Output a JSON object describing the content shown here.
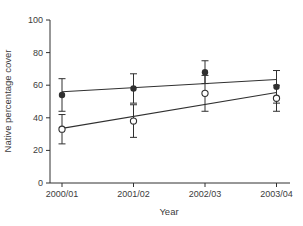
{
  "figure": {
    "background": "#ffffff",
    "text_color": "#3c3c3c",
    "line_color": "#303030"
  },
  "chart_data": {
    "type": "line",
    "xlabel": "Year",
    "ylabel": "Native percentage cover",
    "ylim": [
      0,
      100
    ],
    "yticks": [
      0,
      20,
      40,
      60,
      80,
      100
    ],
    "grid": "off",
    "legend_position": "none",
    "categories": [
      "2000/01",
      "2001/02",
      "2002/03",
      "2003/04"
    ],
    "series": [
      {
        "name": "filled-circle-series",
        "marker": "filled-circle",
        "values": [
          54,
          58,
          68,
          59
        ],
        "error": [
          10,
          9,
          7,
          10
        ],
        "trend": {
          "start": 56,
          "end": 63.5
        }
      },
      {
        "name": "open-circle-series",
        "marker": "open-circle",
        "values": [
          33,
          38,
          55,
          52
        ],
        "error": [
          9,
          10,
          11,
          8
        ],
        "trend": {
          "start": 33.5,
          "end": 55.5
        }
      }
    ]
  }
}
